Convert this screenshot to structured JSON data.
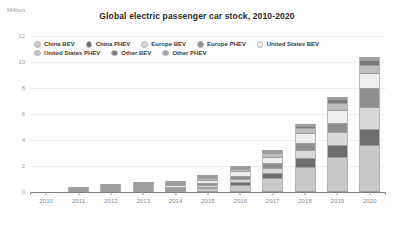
{
  "unit_label": "Million",
  "chart_data": {
    "type": "bar",
    "subtype": "stacked-bar",
    "title": "Global electric passenger car stock, 2010-2020",
    "xlabel": "",
    "ylabel": "Million",
    "ylim": [
      0,
      12
    ],
    "yticks": [
      0,
      2,
      4,
      6,
      8,
      10,
      12
    ],
    "grid": true,
    "legend_position": "top-left-inside",
    "categories": [
      "2010",
      "2011",
      "2012",
      "2013",
      "2014",
      "2015",
      "2016",
      "2017",
      "2018",
      "2019",
      "2020"
    ],
    "series": [
      {
        "name": "China BEV",
        "color": "#c9c9c9",
        "values": [
          0.0,
          0.01,
          0.02,
          0.03,
          0.07,
          0.2,
          0.49,
          1.01,
          1.83,
          2.58,
          3.55
        ]
      },
      {
        "name": "China PHEV",
        "color": "#6e6e6e",
        "values": [
          0.0,
          0.0,
          0.0,
          0.01,
          0.02,
          0.07,
          0.17,
          0.35,
          0.68,
          0.98,
          1.22
        ]
      },
      {
        "name": "Europe BEV",
        "color": "#d8d8d8",
        "values": [
          0.0,
          0.01,
          0.02,
          0.05,
          0.1,
          0.18,
          0.28,
          0.42,
          0.63,
          0.95,
          1.72
        ]
      },
      {
        "name": "Europe PHEV",
        "color": "#8f8f8f",
        "values": [
          0.0,
          0.0,
          0.01,
          0.03,
          0.07,
          0.15,
          0.24,
          0.36,
          0.54,
          0.76,
          1.45
        ]
      },
      {
        "name": "United States BEV",
        "color": "#efefef",
        "values": [
          0.0,
          0.01,
          0.03,
          0.08,
          0.14,
          0.23,
          0.33,
          0.49,
          0.75,
          0.98,
          1.13
        ]
      },
      {
        "name": "United States PHEV",
        "color": "#bdbdbd",
        "values": [
          0.0,
          0.0,
          0.02,
          0.05,
          0.09,
          0.15,
          0.21,
          0.3,
          0.44,
          0.55,
          0.6
        ]
      },
      {
        "name": "Other BEV",
        "color": "#7a7a7a",
        "values": [
          0.0,
          0.0,
          0.01,
          0.01,
          0.02,
          0.04,
          0.06,
          0.1,
          0.16,
          0.25,
          0.38
        ]
      },
      {
        "name": "Other PHEV",
        "color": "#a3a3a3",
        "values": [
          0.0,
          0.0,
          0.0,
          0.01,
          0.01,
          0.02,
          0.03,
          0.05,
          0.08,
          0.12,
          0.17
        ]
      }
    ],
    "totals": [
      0.0,
      0.03,
      0.11,
      0.27,
      0.52,
      1.04,
      1.81,
      3.08,
      5.11,
      7.17,
      10.22
    ]
  },
  "legend": {
    "row1": [
      {
        "label": "China BEV",
        "color": "#c9c9c9"
      },
      {
        "label": "China PHEV",
        "color": "#6e6e6e"
      },
      {
        "label": "Europe BEV",
        "color": "#d8d8d8"
      },
      {
        "label": "Europe PHEV",
        "color": "#8f8f8f"
      },
      {
        "label": "United States BEV",
        "color": "#efefef"
      }
    ],
    "row2": [
      {
        "label": "United States PHEV",
        "color": "#bdbdbd"
      },
      {
        "label": "Other BEV",
        "color": "#7a7a7a"
      },
      {
        "label": "Other PHEV",
        "color": "#a3a3a3"
      }
    ]
  }
}
